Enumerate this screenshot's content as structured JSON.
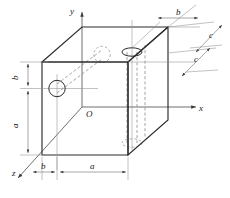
{
  "figure": {
    "type": "engineering-orthographic-3d-block",
    "background_color": "#ffffff",
    "line_color": "#2b2b2b",
    "hidden_line_color": "#8a8a8a",
    "dimension_line_color": "#6b6b6b"
  },
  "axes": {
    "y": {
      "label": "y",
      "direction": "up",
      "arrow": "up-arrow-icon"
    },
    "x": {
      "label": "x",
      "direction": "right",
      "arrow": "right-arrow-icon"
    },
    "z": {
      "label": "z",
      "direction": "down-left",
      "arrow": "diagonal-arrow-icon"
    },
    "origin": {
      "label": "O"
    }
  },
  "dimensions": [
    {
      "id": "left-b",
      "label": "b",
      "orientation": "vertical",
      "location": "left-upper",
      "description": "vertical distance from top face down to left hole center"
    },
    {
      "id": "left-a",
      "label": "a",
      "orientation": "vertical",
      "location": "left-lower",
      "description": "vertical distance from left hole center down to bottom face"
    },
    {
      "id": "bottom-b",
      "label": "b",
      "orientation": "horizontal",
      "location": "bottom-left",
      "description": "horizontal offset along z from front-left corner"
    },
    {
      "id": "bottom-a",
      "label": "a",
      "orientation": "horizontal",
      "location": "bottom-right",
      "description": "horizontal width of the front face along x"
    },
    {
      "id": "top-b",
      "label": "b",
      "orientation": "horizontal",
      "location": "top-right",
      "description": "offset of the vertical hole from the right rear edge"
    },
    {
      "id": "right-c-upper",
      "label": "c",
      "orientation": "diagonal",
      "location": "right-upper",
      "description": "depth dimension along z, upper"
    },
    {
      "id": "right-c-lower",
      "label": "c",
      "orientation": "diagonal",
      "location": "right-lower",
      "description": "depth dimension along z, lower"
    }
  ],
  "features": [
    {
      "id": "left-face-hole",
      "kind": "circle",
      "style": "solid",
      "face": "left",
      "description": "circular through-hole visible on the left face"
    },
    {
      "id": "back-face-hole",
      "kind": "circle",
      "style": "hidden-dashed",
      "face": "back",
      "description": "hidden outlet of the horizontal hole on the far face"
    },
    {
      "id": "top-face-hole",
      "kind": "ellipse",
      "style": "solid",
      "face": "top",
      "description": "elliptical opening of the vertical cylindrical hole on the top face"
    },
    {
      "id": "bottom-face-hole",
      "kind": "ellipse",
      "style": "hidden-dashed",
      "face": "bottom",
      "description": "hidden outlet of the vertical hole on the bottom face"
    }
  ]
}
